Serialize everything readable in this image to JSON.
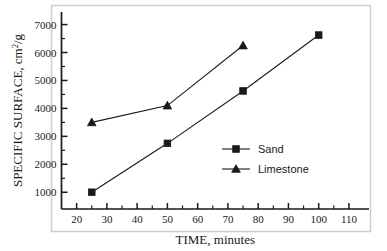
{
  "chart_data": {
    "type": "line",
    "title": "",
    "xlabel": "TIME, minutes",
    "ylabel": "SPECIFIC SURFACE, cm2/g",
    "ylabel_parts": {
      "pre": "SPECIFIC SURFACE, cm",
      "sup": "2",
      "post": "/g"
    },
    "xlim": [
      15,
      112
    ],
    "ylim": [
      400,
      7450
    ],
    "xticks": [
      20,
      30,
      40,
      50,
      60,
      70,
      80,
      90,
      100,
      110
    ],
    "xtick_labels": [
      "20",
      "30",
      "40",
      "50",
      "60",
      "70",
      "80",
      "90",
      "100",
      "110"
    ],
    "yticks": [
      1000,
      2000,
      3000,
      4000,
      5000,
      6000,
      7000
    ],
    "ytick_labels": [
      "1000",
      "2000",
      "3000",
      "4000",
      "5000",
      "6000",
      "7000"
    ],
    "x_minor_ticks": [
      25,
      35,
      45,
      55,
      65,
      75,
      85,
      95,
      105
    ],
    "y_minor_ticks": [
      1500,
      2500,
      3500,
      4500,
      5500,
      6500
    ],
    "grid": false,
    "legend_position": "center-right-inside",
    "series": [
      {
        "name": "Sand",
        "marker": "square",
        "color": "#1a1a1a",
        "x": [
          25,
          50,
          75,
          100
        ],
        "values": [
          1000,
          2750,
          4625,
          6625
        ]
      },
      {
        "name": "Limestone",
        "marker": "triangle",
        "color": "#1a1a1a",
        "x": [
          25,
          50,
          75
        ],
        "values": [
          3500,
          4100,
          6250
        ]
      }
    ]
  },
  "axes": {
    "frame_color": "#1a1a1a",
    "outer_frame_color": "#cfcfcf"
  },
  "legend": {
    "entries": [
      {
        "label": "Sand",
        "marker": "square"
      },
      {
        "label": "Limestone",
        "marker": "triangle"
      }
    ]
  }
}
